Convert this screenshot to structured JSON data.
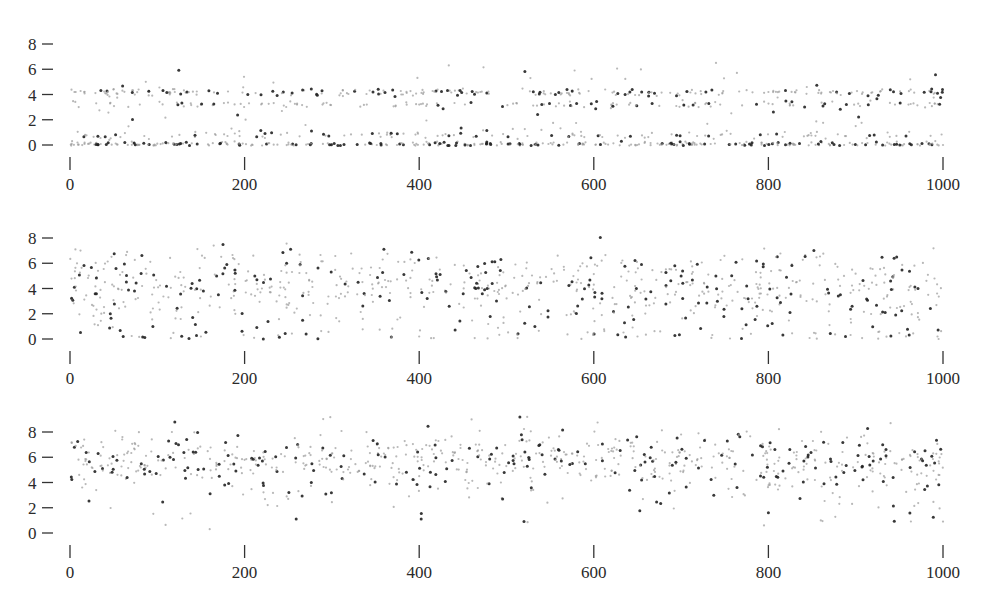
{
  "chart_data": [
    {
      "type": "scatter",
      "title": "",
      "xlabel": "",
      "ylabel": "",
      "xlim": [
        0,
        1000
      ],
      "ylim": [
        0,
        8
      ],
      "x_ticks": [
        0,
        200,
        400,
        600,
        800,
        1000
      ],
      "y_ticks": [
        0,
        2,
        4,
        6,
        8
      ],
      "grid": false,
      "legend": null,
      "description": "Points clustered in horizontal bands near y=0, y~0.8, y~3.2 and y~4.2, with sparse points up to ~6.5",
      "bands": [
        {
          "y": 0.05,
          "spread": 0.12,
          "weight": 0.38
        },
        {
          "y": 0.8,
          "spread": 0.15,
          "weight": 0.12
        },
        {
          "y": 3.2,
          "spread": 0.12,
          "weight": 0.14
        },
        {
          "y": 4.15,
          "spread": 0.15,
          "weight": 0.26
        },
        {
          "y": 2.2,
          "spread": 1.2,
          "weight": 0.07
        },
        {
          "y": 5.3,
          "spread": 0.6,
          "weight": 0.03
        }
      ],
      "n_points": 900,
      "seed": 11,
      "sample_points": [
        [
          5,
          4.2
        ],
        [
          10,
          3.0
        ],
        [
          22,
          0.1
        ],
        [
          30,
          3.3
        ],
        [
          45,
          0.4
        ],
        [
          60,
          4.3
        ],
        [
          80,
          3.2
        ],
        [
          100,
          0.1
        ],
        [
          120,
          4.2
        ],
        [
          150,
          3.2
        ],
        [
          185,
          1.3
        ],
        [
          205,
          3.3
        ],
        [
          260,
          3.2
        ],
        [
          300,
          0.05
        ],
        [
          340,
          3.2
        ],
        [
          400,
          3.2
        ],
        [
          470,
          4.2
        ],
        [
          560,
          3.3
        ],
        [
          578,
          5.9
        ],
        [
          620,
          3.2
        ],
        [
          720,
          3.0
        ],
        [
          740,
          6.5
        ],
        [
          800,
          4.2
        ],
        [
          900,
          1.5
        ],
        [
          945,
          3.2
        ],
        [
          1000,
          0.0
        ]
      ]
    },
    {
      "type": "scatter",
      "title": "",
      "xlabel": "",
      "ylabel": "",
      "xlim": [
        0,
        1000
      ],
      "ylim": [
        0,
        8
      ],
      "x_ticks": [
        0,
        200,
        400,
        600,
        800,
        1000
      ],
      "y_ticks": [
        0,
        2,
        4,
        6,
        8
      ],
      "grid": false,
      "legend": null,
      "description": "Widely scattered points between 0 and 7.2, densest around y~4",
      "bands": [
        {
          "y": 4.2,
          "spread": 1.1,
          "weight": 0.7
        },
        {
          "y": 2.0,
          "spread": 1.0,
          "weight": 0.15
        },
        {
          "y": 0.3,
          "spread": 0.25,
          "weight": 0.08
        },
        {
          "y": 6.4,
          "spread": 0.5,
          "weight": 0.07
        }
      ],
      "n_points": 800,
      "seed": 23,
      "sample_points": [
        [
          5,
          4.1
        ],
        [
          8,
          6.0
        ],
        [
          12,
          7.0
        ],
        [
          40,
          4.5
        ],
        [
          60,
          5.3
        ],
        [
          95,
          1.0
        ],
        [
          150,
          0.2
        ],
        [
          170,
          3.5
        ],
        [
          210,
          6.6
        ],
        [
          250,
          2.7
        ],
        [
          330,
          4.5
        ],
        [
          400,
          0.2
        ],
        [
          480,
          4.0
        ],
        [
          600,
          4.3
        ],
        [
          650,
          0.2
        ],
        [
          700,
          5.0
        ],
        [
          790,
          4.3
        ],
        [
          870,
          1.1
        ],
        [
          940,
          4.6
        ],
        [
          995,
          0.0
        ]
      ]
    },
    {
      "type": "scatter",
      "title": "",
      "xlabel": "",
      "ylabel": "",
      "xlim": [
        0,
        1000
      ],
      "ylim": [
        0,
        8
      ],
      "x_ticks": [
        0,
        200,
        400,
        600,
        800,
        1000
      ],
      "y_ticks": [
        0,
        2,
        4,
        6,
        8
      ],
      "grid": false,
      "legend": null,
      "description": "Points concentrated between 4 and 8, centered near 5.8, few outliers down to ~0.3",
      "bands": [
        {
          "y": 5.8,
          "spread": 1.1,
          "weight": 0.9
        },
        {
          "y": 3.2,
          "spread": 0.8,
          "weight": 0.08
        },
        {
          "y": 1.2,
          "spread": 0.7,
          "weight": 0.02
        }
      ],
      "n_points": 800,
      "seed": 37,
      "sample_points": [
        [
          5,
          6.8
        ],
        [
          15,
          6.9
        ],
        [
          30,
          3.4
        ],
        [
          60,
          7.6
        ],
        [
          120,
          8.8
        ],
        [
          160,
          0.3
        ],
        [
          200,
          5.8
        ],
        [
          300,
          6.3
        ],
        [
          400,
          4.5
        ],
        [
          460,
          9.0
        ],
        [
          520,
          0.9
        ],
        [
          620,
          6.5
        ],
        [
          700,
          7.8
        ],
        [
          795,
          0.6
        ],
        [
          800,
          1.6
        ],
        [
          860,
          1.0
        ],
        [
          940,
          8.7
        ],
        [
          1000,
          0.9
        ],
        [
          995,
          4.6
        ]
      ]
    }
  ],
  "panels": [
    {
      "y_labels": [
        "8",
        "6",
        "4",
        "2",
        "0"
      ],
      "x_labels": [
        "0",
        "200",
        "400",
        "600",
        "800",
        "1000"
      ]
    },
    {
      "y_labels": [
        "8",
        "6",
        "4",
        "2",
        "0"
      ],
      "x_labels": [
        "0",
        "200",
        "400",
        "600",
        "800",
        "1000"
      ]
    },
    {
      "y_labels": [
        "8",
        "6",
        "4",
        "2",
        "0"
      ],
      "x_labels": [
        "0",
        "200",
        "400",
        "600",
        "800",
        "1000"
      ]
    }
  ],
  "colors": {
    "point_dark": "#222222",
    "point_light": "#9a9a9a",
    "axis": "#333333"
  }
}
